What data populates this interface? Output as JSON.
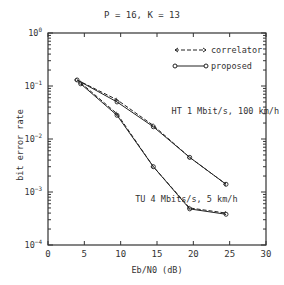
{
  "chart_data": {
    "type": "line",
    "title": "P = 16, K = 13",
    "xlabel": "Eb/N0 (dB)",
    "ylabel": "bit error rate",
    "xlim": [
      0,
      30
    ],
    "ylim": [
      0.0001,
      1
    ],
    "yscale": "log",
    "xticks": [
      0,
      5,
      10,
      15,
      20,
      25,
      30
    ],
    "yticks": [
      "10^0",
      "10^-1",
      "10^-2",
      "10^-3",
      "10^-4"
    ],
    "grid": false,
    "legend": {
      "position": "upper right",
      "entries": [
        {
          "label": "correlator",
          "style": "dashed",
          "marker": "arrow"
        },
        {
          "label": "proposed",
          "style": "solid",
          "marker": "circle"
        }
      ]
    },
    "annotations": [
      {
        "text": "HT 1 Mbit/s, 100 km/h",
        "x": 17,
        "y": 0.03
      },
      {
        "text": "TU 4 Mbits/s, 5 km/h",
        "x": 12,
        "y": 0.00065
      }
    ],
    "series": [
      {
        "name": "HT 1 Mbit/s, 100 km/h - correlator",
        "style": "dashed",
        "x": [
          4,
          9.5,
          14.5,
          19.5,
          24.5
        ],
        "y": [
          0.13,
          0.055,
          0.018,
          0.0045,
          0.0014
        ]
      },
      {
        "name": "HT 1 Mbit/s, 100 km/h - proposed",
        "style": "solid",
        "x": [
          4,
          9.5,
          14.5,
          19.5,
          24.5
        ],
        "y": [
          0.13,
          0.05,
          0.017,
          0.0045,
          0.0014
        ]
      },
      {
        "name": "TU 4 Mbits/s, 5 km/h - correlator",
        "style": "dashed",
        "x": [
          4.5,
          9.5,
          14.5,
          19.5,
          24.5
        ],
        "y": [
          0.115,
          0.03,
          0.003,
          0.0005,
          0.0004
        ]
      },
      {
        "name": "TU 4 Mbits/s, 5 km/h - proposed",
        "style": "solid",
        "x": [
          4.5,
          9.5,
          14.5,
          19.5,
          24.5
        ],
        "y": [
          0.11,
          0.028,
          0.003,
          0.00048,
          0.00038
        ]
      }
    ]
  }
}
